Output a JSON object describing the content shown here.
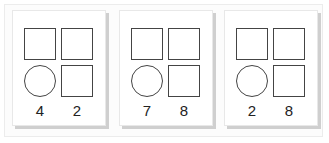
{
  "figure": {
    "cards": [
      {
        "shapes": [
          "square",
          "square",
          "circle",
          "square"
        ],
        "numbers": [
          "4",
          "2"
        ]
      },
      {
        "shapes": [
          "square",
          "square",
          "circle",
          "square"
        ],
        "numbers": [
          "7",
          "8"
        ]
      },
      {
        "shapes": [
          "square",
          "square",
          "circle",
          "square"
        ],
        "numbers": [
          "2",
          "8"
        ]
      }
    ]
  }
}
